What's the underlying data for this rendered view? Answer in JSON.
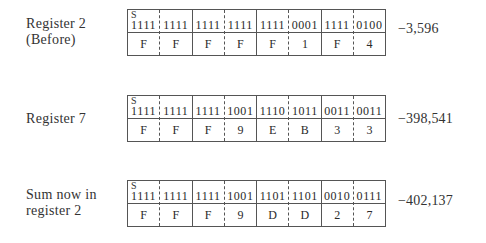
{
  "sign_marker": "S",
  "rows": [
    {
      "label_lines": [
        "Register 2",
        "(Before)"
      ],
      "nibbles": [
        {
          "bits": "1111",
          "hex": "F"
        },
        {
          "bits": "1111",
          "hex": "F"
        },
        {
          "bits": "1111",
          "hex": "F"
        },
        {
          "bits": "1111",
          "hex": "F"
        },
        {
          "bits": "1111",
          "hex": "F"
        },
        {
          "bits": "0001",
          "hex": "1"
        },
        {
          "bits": "1111",
          "hex": "F"
        },
        {
          "bits": "0100",
          "hex": "4"
        }
      ],
      "decimal_value": "−3,596"
    },
    {
      "label_lines": [
        "Register 7"
      ],
      "nibbles": [
        {
          "bits": "1111",
          "hex": "F"
        },
        {
          "bits": "1111",
          "hex": "F"
        },
        {
          "bits": "1111",
          "hex": "F"
        },
        {
          "bits": "1001",
          "hex": "9"
        },
        {
          "bits": "1110",
          "hex": "E"
        },
        {
          "bits": "1011",
          "hex": "B"
        },
        {
          "bits": "0011",
          "hex": "3"
        },
        {
          "bits": "0011",
          "hex": "3"
        }
      ],
      "decimal_value": "−398,541"
    },
    {
      "label_lines": [
        "Sum now in",
        "register 2"
      ],
      "nibbles": [
        {
          "bits": "1111",
          "hex": "F"
        },
        {
          "bits": "1111",
          "hex": "F"
        },
        {
          "bits": "1111",
          "hex": "F"
        },
        {
          "bits": "1001",
          "hex": "9"
        },
        {
          "bits": "1101",
          "hex": "D"
        },
        {
          "bits": "1101",
          "hex": "D"
        },
        {
          "bits": "0010",
          "hex": "2"
        },
        {
          "bits": "0111",
          "hex": "7"
        }
      ],
      "decimal_value": "−402,137"
    }
  ]
}
